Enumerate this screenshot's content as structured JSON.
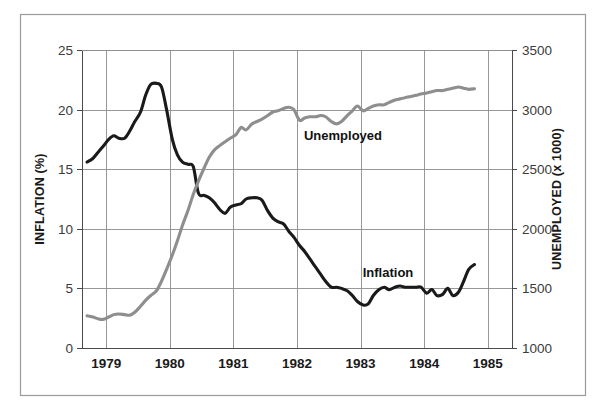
{
  "figure": {
    "background_color": "#ffffff",
    "border_color": "#9a9a9a",
    "grid_color": "#8d8d8d"
  },
  "chart_data": {
    "type": "line",
    "title": "",
    "xlabel": "",
    "grid": true,
    "legend_position": "inline-annotation",
    "x_axis": {
      "tick_labels": [
        "1979",
        "1980",
        "1981",
        "1982",
        "1983",
        "1984",
        "1985"
      ],
      "tick_values": [
        1979,
        1980,
        1981,
        1982,
        1983,
        1984,
        1985
      ],
      "xlim": [
        1978.62,
        1985.38
      ]
    },
    "y_axis_left": {
      "label": "INFLATION (%)",
      "tick_labels": [
        "0",
        "5",
        "10",
        "15",
        "20",
        "25"
      ],
      "tick_values": [
        0,
        5,
        10,
        15,
        20,
        25
      ],
      "ylim": [
        0,
        25
      ]
    },
    "y_axis_right": {
      "label": "UNEMPLOYED (x 1000)",
      "tick_labels": [
        "1000",
        "1500",
        "2000",
        "2500",
        "3000",
        "3500"
      ],
      "tick_values": [
        1000,
        1500,
        2000,
        2500,
        3000,
        3500
      ],
      "ylim": [
        1000,
        3500
      ]
    },
    "series": [
      {
        "name": "Inflation",
        "annotation_label": "Inflation",
        "axis": "left",
        "color": "#1a1a1a",
        "stroke_width": 3.1,
        "unit": "%",
        "x": [
          1978.7,
          1978.79,
          1978.87,
          1978.95,
          1979.04,
          1979.12,
          1979.2,
          1979.29,
          1979.37,
          1979.45,
          1979.54,
          1979.62,
          1979.7,
          1979.79,
          1979.87,
          1979.95,
          1980.04,
          1980.12,
          1980.2,
          1980.29,
          1980.37,
          1980.45,
          1980.54,
          1980.62,
          1980.7,
          1980.79,
          1980.87,
          1980.95,
          1981.04,
          1981.12,
          1981.2,
          1981.29,
          1981.37,
          1981.45,
          1981.54,
          1981.62,
          1981.7,
          1981.79,
          1981.87,
          1981.95,
          1982.04,
          1982.12,
          1982.2,
          1982.29,
          1982.37,
          1982.45,
          1982.54,
          1982.62,
          1982.7,
          1982.79,
          1982.87,
          1982.95,
          1983.04,
          1983.12,
          1983.2,
          1983.29,
          1983.37,
          1983.45,
          1983.54,
          1983.62,
          1983.7,
          1983.79,
          1983.87,
          1983.95,
          1984.04,
          1984.12,
          1984.2,
          1984.29,
          1984.37,
          1984.45,
          1984.54,
          1984.62,
          1984.7,
          1984.79
        ],
        "y": [
          15.6,
          15.9,
          16.4,
          16.9,
          17.5,
          17.8,
          17.6,
          17.6,
          18.2,
          19.0,
          19.8,
          21.2,
          22.1,
          22.2,
          21.9,
          20.0,
          17.5,
          16.2,
          15.6,
          15.4,
          15.2,
          13.0,
          12.8,
          12.6,
          12.2,
          11.6,
          11.3,
          11.8,
          12.0,
          12.1,
          12.5,
          12.6,
          12.6,
          12.4,
          11.5,
          10.9,
          10.6,
          10.4,
          9.8,
          9.3,
          8.6,
          8.1,
          7.5,
          6.8,
          6.2,
          5.6,
          5.1,
          5.1,
          5.0,
          4.8,
          4.4,
          3.9,
          3.6,
          3.7,
          4.4,
          4.9,
          5.1,
          4.9,
          5.1,
          5.2,
          5.1,
          5.1,
          5.1,
          5.1,
          4.6,
          4.9,
          4.4,
          4.5,
          5.0,
          4.4,
          4.7,
          5.6,
          6.6,
          7.0
        ]
      },
      {
        "name": "Unemployed",
        "annotation_label": "Unemployed",
        "axis": "right",
        "color": "#8e8e8e",
        "stroke_width": 3.1,
        "unit": "thousands",
        "x": [
          1978.7,
          1978.79,
          1978.87,
          1978.95,
          1979.04,
          1979.12,
          1979.2,
          1979.29,
          1979.37,
          1979.45,
          1979.54,
          1979.62,
          1979.7,
          1979.79,
          1979.87,
          1979.95,
          1980.04,
          1980.12,
          1980.2,
          1980.29,
          1980.37,
          1980.45,
          1980.54,
          1980.62,
          1980.7,
          1980.79,
          1980.87,
          1980.95,
          1981.04,
          1981.12,
          1981.2,
          1981.29,
          1981.37,
          1981.45,
          1981.54,
          1981.62,
          1981.7,
          1981.79,
          1981.87,
          1981.95,
          1982.04,
          1982.12,
          1982.2,
          1982.29,
          1982.37,
          1982.45,
          1982.54,
          1982.62,
          1982.7,
          1982.79,
          1982.87,
          1982.95,
          1983.04,
          1983.12,
          1983.2,
          1983.29,
          1983.37,
          1983.45,
          1983.54,
          1983.62,
          1983.7,
          1983.79,
          1983.87,
          1983.95,
          1984.04,
          1984.12,
          1984.2,
          1984.29,
          1984.37,
          1984.45,
          1984.54,
          1984.62,
          1984.7,
          1984.79
        ],
        "y": [
          1270,
          1260,
          1245,
          1240,
          1260,
          1280,
          1285,
          1280,
          1275,
          1300,
          1350,
          1400,
          1440,
          1480,
          1560,
          1660,
          1780,
          1900,
          2030,
          2160,
          2290,
          2400,
          2510,
          2600,
          2660,
          2700,
          2730,
          2760,
          2790,
          2850,
          2830,
          2880,
          2900,
          2920,
          2950,
          2980,
          2990,
          3010,
          3020,
          3000,
          2910,
          2930,
          2940,
          2940,
          2950,
          2940,
          2900,
          2880,
          2900,
          2950,
          2990,
          3030,
          2990,
          3010,
          3030,
          3040,
          3040,
          3060,
          3080,
          3090,
          3100,
          3110,
          3120,
          3130,
          3140,
          3150,
          3160,
          3160,
          3170,
          3180,
          3190,
          3180,
          3170,
          3175
        ]
      }
    ],
    "annotations": [
      {
        "text": "Unemployed",
        "x": 1982.05,
        "y_pixel": 135
      },
      {
        "text": "Inflation",
        "x": 1983.3,
        "y_pixel": 272
      }
    ]
  }
}
